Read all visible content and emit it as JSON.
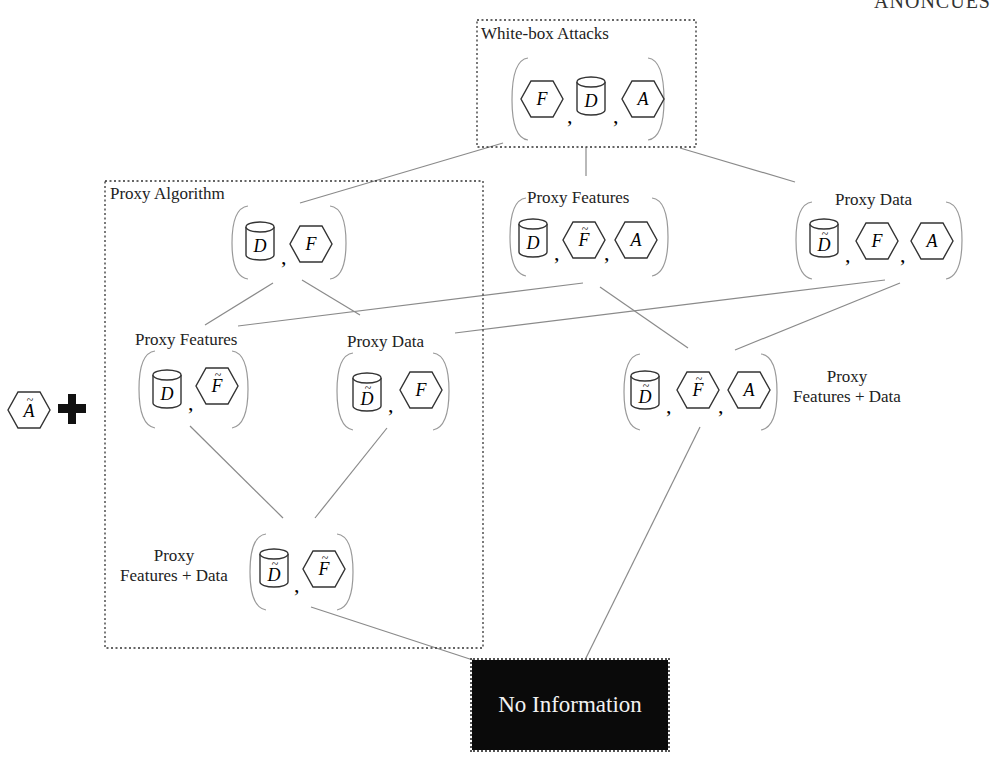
{
  "header": {
    "clipped_title": "ANONCUES"
  },
  "legend_prefix": {
    "icon": "algorithm-tilde",
    "symbol": "Ã",
    "operator": "plus"
  },
  "groups": {
    "whitebox": {
      "title": "White-box Attacks"
    },
    "proxy_algorithm": {
      "title": "Proxy Algorithm"
    }
  },
  "nodes": {
    "whitebox": {
      "label": "",
      "items": [
        "F",
        "D",
        "A"
      ]
    },
    "pa_root": {
      "label": "",
      "items": [
        "D",
        "F"
      ]
    },
    "proxy_features": {
      "label": "Proxy Features",
      "items": [
        "D",
        "F̃",
        "A"
      ]
    },
    "proxy_data": {
      "label": "Proxy Data",
      "items": [
        "D̃",
        "F",
        "A"
      ]
    },
    "pa_proxy_features": {
      "label": "Proxy Features",
      "items": [
        "D",
        "F̃"
      ]
    },
    "pa_proxy_data": {
      "label": "Proxy Data",
      "items": [
        "D̃",
        "F"
      ]
    },
    "proxy_feat_data": {
      "label_line1": "Proxy",
      "label_line2": "Features + Data",
      "items": [
        "D̃",
        "F̃",
        "A"
      ]
    },
    "pa_proxy_feat_data": {
      "label_line1": "Proxy",
      "label_line2": "Features + Data",
      "items": [
        "D̃",
        "F̃"
      ]
    },
    "no_information": {
      "label": "No Information"
    }
  },
  "symbols": {
    "F": "F",
    "D": "D",
    "A": "A",
    "tilde": "~"
  },
  "colors": {
    "line": "#8a8a8a",
    "stroke": "#333333",
    "noinfo_bg": "#0a0a0a",
    "noinfo_text": "#f2f2f2"
  }
}
